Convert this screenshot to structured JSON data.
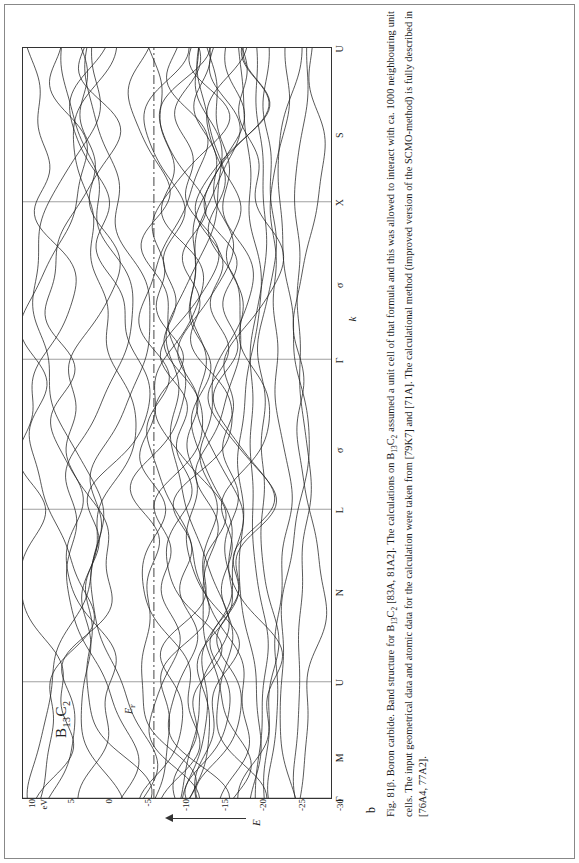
{
  "figure": {
    "subfigure_letter": "b",
    "panel_formula": "B13C2",
    "panel_formula_parts": {
      "b": "B",
      "b_sub": "13",
      "c": "C",
      "c_sub": "2"
    },
    "fermi_label": "EF",
    "energy_axis_label": "E",
    "energy_unit": "eV",
    "k_axis_label": "k"
  },
  "chart_data": {
    "type": "line",
    "xlabel": "k",
    "ylabel": "E",
    "yunit": "eV",
    "ylim": [
      -30,
      10
    ],
    "yticks": [
      10,
      5,
      0,
      -5,
      -10,
      -15,
      -20,
      -25,
      -30
    ],
    "ytick_labels": [
      "10",
      "5",
      "0",
      "-5",
      "-10",
      "-15",
      "-20",
      "-25",
      "-30"
    ],
    "grid": "vertical-symmetry-lines-only",
    "legend": "none",
    "fermi_level": -7.0,
    "x_symmetry_points": [
      {
        "label": "Γ",
        "pos": 0.0,
        "line": true
      },
      {
        "label": "M",
        "pos": 0.055,
        "line": false
      },
      {
        "label": "U",
        "pos": 0.155,
        "line": true
      },
      {
        "label": "N",
        "pos": 0.275,
        "line": false
      },
      {
        "label": "L",
        "pos": 0.385,
        "line": true
      },
      {
        "label": "σ",
        "pos": 0.465,
        "line": false
      },
      {
        "label": "Γ",
        "pos": 0.585,
        "line": true
      },
      {
        "label": "σ",
        "pos": 0.685,
        "line": false
      },
      {
        "label": "X",
        "pos": 0.795,
        "line": true
      },
      {
        "label": "S",
        "pos": 0.885,
        "line": false
      },
      {
        "label": "U",
        "pos": 1.0,
        "line": false
      }
    ],
    "series_note": "approximately 34 electronic bands plotted over the k-path Γ-M-U-N-L-σ-Γ-σ-X-S-U",
    "band_count": 34
  },
  "caption": {
    "figure_number": "Fig. 81β.",
    "line1_a": "Boron carbide. Band structure for B",
    "line1_b": "C",
    "line1_c": " [83A, 81A2]. The calculations on B",
    "line1_d": "C",
    "line1_e": " assumed a unit cell of that formula and this was allowed to interact with ca.",
    "line2": "1000 neighbouring unit cells. The input geometrical data and atomic data for the calculation were taken from [79K7] and [71A]. The calculational method (improved version",
    "line3": "of the SCMO-method) is fully described in [76A4, 77A2].",
    "sub_13": "13",
    "sub_2": "2"
  },
  "colors": {
    "ink": "#1a1a1a",
    "axis": "#333333",
    "band": "#222222",
    "fermi": "#444444",
    "border": "#888888"
  }
}
